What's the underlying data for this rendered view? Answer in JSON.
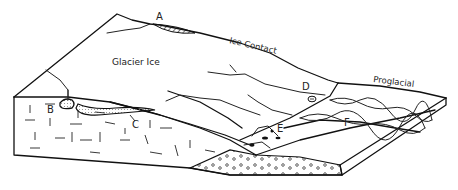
{
  "diagram": {
    "type": "glacial block diagram",
    "region_labels": {
      "glacier_ice": "Glacier Ice",
      "ice_contact": "Ice Contact",
      "proglacial": "Proglacial"
    },
    "feature_labels": {
      "a": "A",
      "b": "B",
      "c": "C",
      "d": "D",
      "e": "E",
      "f": "F"
    },
    "colors": {
      "ink": "#111111",
      "background": "#ffffff"
    }
  }
}
